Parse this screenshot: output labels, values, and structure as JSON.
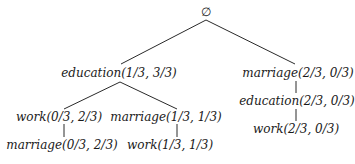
{
  "tree": {
    "root": {
      "label": "∅"
    },
    "nodes": {
      "education_l1": "education(1/3, 3/3)",
      "marriage_r1": "marriage(2/3, 0/3)",
      "work_l2": "work(0/3, 2/3)",
      "marriage_l2": "marriage(1/3, 1/3)",
      "marriage_l3": "marriage(0/3, 2/3)",
      "work_l3": "work(1/3, 1/3)",
      "education_r2": "education(2/3, 0/3)",
      "work_r3": "work(2/3, 0/3)"
    },
    "edge_color": "#2a2a2a",
    "text_color": "#1a1a1a"
  }
}
